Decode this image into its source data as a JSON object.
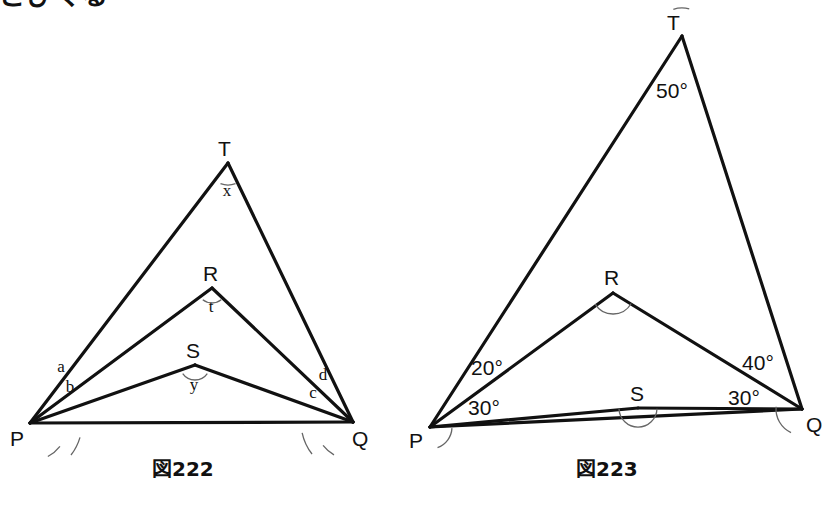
{
  "page": {
    "width": 835,
    "height": 510,
    "background_color": "#ffffff",
    "stroke_color": "#111111",
    "arc_color": "#666666",
    "clipped_header_text": "とびくる"
  },
  "figures": [
    {
      "id": "figure-222",
      "caption": "図222",
      "caption_position": {
        "x": 152,
        "y": 453
      },
      "vertices": {
        "P": {
          "x": 30,
          "y": 423,
          "label": "P",
          "label_x": 10,
          "label_y": 446
        },
        "Q": {
          "x": 353,
          "y": 422,
          "label": "Q",
          "label_x": 352,
          "label_y": 446
        },
        "R": {
          "x": 212,
          "y": 288,
          "label": "R",
          "label_x": 203,
          "label_y": 281
        },
        "S": {
          "x": 195,
          "y": 365,
          "label": "S",
          "label_x": 186,
          "label_y": 358
        },
        "T": {
          "x": 228,
          "y": 163,
          "label": "T",
          "label_x": 218,
          "label_y": 156
        }
      },
      "edges": [
        {
          "from": "P",
          "to": "Q",
          "name": "segment-pq"
        },
        {
          "from": "P",
          "to": "T",
          "name": "segment-pt"
        },
        {
          "from": "T",
          "to": "Q",
          "name": "segment-tq"
        },
        {
          "from": "P",
          "to": "R",
          "name": "segment-pr"
        },
        {
          "from": "R",
          "to": "Q",
          "name": "segment-rq"
        },
        {
          "from": "P",
          "to": "S",
          "name": "segment-ps"
        },
        {
          "from": "S",
          "to": "Q",
          "name": "segment-sq"
        }
      ],
      "angle_labels": [
        {
          "name": "angle-x-at-t",
          "text": "x",
          "x": 227,
          "y": 196,
          "style": "letter"
        },
        {
          "name": "angle-t-at-r",
          "text": "t",
          "x": 211,
          "y": 312,
          "style": "letter"
        },
        {
          "name": "angle-y-at-s",
          "text": "y",
          "x": 194,
          "y": 390,
          "style": "letter"
        },
        {
          "name": "angle-a-at-p",
          "text": "a",
          "x": 61,
          "y": 372,
          "style": "letter"
        },
        {
          "name": "angle-b-at-p",
          "text": "b",
          "x": 70,
          "y": 392,
          "style": "letter"
        },
        {
          "name": "angle-d-at-q",
          "text": "d",
          "x": 323,
          "y": 380,
          "style": "letter"
        },
        {
          "name": "angle-c-at-q",
          "text": "c",
          "x": 313,
          "y": 398,
          "style": "letter"
        }
      ],
      "angle_arcs": [
        {
          "name": "arc-t",
          "cx": 228,
          "cy": 163,
          "r": 22,
          "a1": 250,
          "a2": 290
        },
        {
          "name": "arc-r",
          "cx": 212,
          "cy": 288,
          "r": 15,
          "a1": 232,
          "a2": 308
        },
        {
          "name": "arc-s",
          "cx": 195,
          "cy": 365,
          "r": 15,
          "a1": 215,
          "a2": 325
        },
        {
          "name": "arc-a",
          "cx": 30,
          "cy": 423,
          "r": 38,
          "a1": 298,
          "a2": 322
        },
        {
          "name": "arc-b",
          "cx": 30,
          "cy": 423,
          "r": 52,
          "a1": 322,
          "a2": 344
        },
        {
          "name": "arc-d",
          "cx": 353,
          "cy": 422,
          "r": 38,
          "a1": 218,
          "a2": 240
        },
        {
          "name": "arc-c",
          "cx": 353,
          "cy": 422,
          "r": 52,
          "a1": 192,
          "a2": 218
        }
      ]
    },
    {
      "id": "figure-223",
      "caption": "図223",
      "caption_position": {
        "x": 576,
        "y": 453
      },
      "vertices": {
        "P": {
          "x": 430,
          "y": 427,
          "label": "P",
          "label_x": 409,
          "label_y": 448
        },
        "Q": {
          "x": 802,
          "y": 409,
          "label": "Q",
          "label_x": 806,
          "label_y": 432
        },
        "R": {
          "x": 613,
          "y": 293,
          "label": "R",
          "label_x": 604,
          "label_y": 285
        },
        "S": {
          "x": 638,
          "y": 408,
          "label": "S",
          "label_x": 630,
          "label_y": 401
        },
        "T": {
          "x": 682,
          "y": 36,
          "label": "T",
          "label_x": 667,
          "label_y": 30
        }
      },
      "edges": [
        {
          "from": "P",
          "to": "Q",
          "name": "segment-pq"
        },
        {
          "from": "P",
          "to": "T",
          "name": "segment-pt"
        },
        {
          "from": "T",
          "to": "Q",
          "name": "segment-tq"
        },
        {
          "from": "P",
          "to": "R",
          "name": "segment-pr"
        },
        {
          "from": "R",
          "to": "Q",
          "name": "segment-rq"
        },
        {
          "from": "P",
          "to": "S",
          "name": "segment-ps"
        },
        {
          "from": "S",
          "to": "Q",
          "name": "segment-sq"
        }
      ],
      "angle_labels": [
        {
          "name": "angle-50-at-t",
          "text": "50°",
          "x": 672,
          "y": 98,
          "style": "value"
        },
        {
          "name": "angle-20-at-p",
          "text": "20°",
          "x": 487,
          "y": 375,
          "style": "value"
        },
        {
          "name": "angle-30-at-p",
          "text": "30°",
          "x": 484,
          "y": 415,
          "style": "value"
        },
        {
          "name": "angle-40-at-q",
          "text": "40°",
          "x": 758,
          "y": 370,
          "style": "value"
        },
        {
          "name": "angle-30-at-q",
          "text": "30°",
          "x": 744,
          "y": 405,
          "style": "value"
        }
      ],
      "angle_arcs": [
        {
          "name": "arc-t",
          "cx": 682,
          "cy": 36,
          "r": 28,
          "a1": 75,
          "a2": 108
        },
        {
          "name": "arc-r",
          "cx": 613,
          "cy": 293,
          "r": 21,
          "a1": 212,
          "a2": 330
        },
        {
          "name": "arc-s",
          "cx": 638,
          "cy": 408,
          "r": 19,
          "a1": 182,
          "a2": 358
        },
        {
          "name": "arc-p",
          "cx": 430,
          "cy": 427,
          "r": 22,
          "a1": 290,
          "a2": 357
        },
        {
          "name": "arc-q",
          "cx": 802,
          "cy": 409,
          "r": 26,
          "a1": 175,
          "a2": 245
        }
      ]
    }
  ]
}
